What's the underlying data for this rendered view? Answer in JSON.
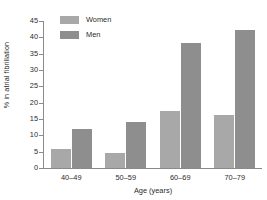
{
  "chart_data": {
    "type": "bar",
    "title": "",
    "subtitle": "",
    "xlabel": "Age (years)",
    "ylabel": "% in atrial fibrillation",
    "categories": [
      "40–49",
      "50–59",
      "60–69",
      "70–79"
    ],
    "series": [
      {
        "name": "Women",
        "color": "#a8a8a8",
        "values": [
          5.7,
          4.6,
          17.5,
          16.3
        ]
      },
      {
        "name": "Men",
        "color": "#8e8e8e",
        "values": [
          12.0,
          14.0,
          38.2,
          42.3
        ]
      }
    ],
    "ylim": [
      0,
      45
    ],
    "ytick_values": [
      0,
      5,
      10,
      15,
      20,
      25,
      30,
      35,
      40,
      45
    ],
    "ytick_labels": [
      "0",
      "5",
      "10",
      "15",
      "20",
      "25",
      "30",
      "35",
      "40",
      "45"
    ],
    "grid": false,
    "legend_position": "top-left",
    "axis_color": "#8a8a8a"
  }
}
